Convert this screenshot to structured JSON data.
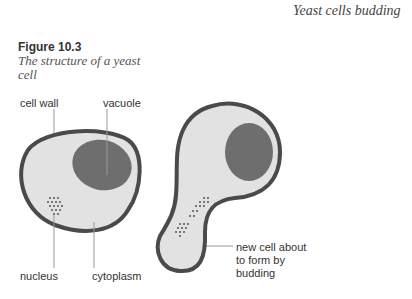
{
  "header": {
    "caption": "Yeast cells budding"
  },
  "figure": {
    "number": "Figure 10.3",
    "title": "The structure of a yeast cell"
  },
  "labels": {
    "cell_wall": "cell wall",
    "vacuole": "vacuole",
    "nucleus": "nucleus",
    "cytoplasm": "cytoplasm",
    "bud_line1": "new cell about",
    "bud_line2": "to form by",
    "bud_line3": "budding"
  },
  "colors": {
    "cell_wall": "#4a4a4a",
    "cytoplasm": "#e2e2e2",
    "vacuole": "#6e6e6e",
    "leader": "#999999"
  }
}
